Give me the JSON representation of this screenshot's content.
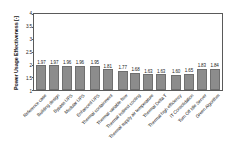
{
  "chart_data": {
    "type": "bar",
    "title": "",
    "xlabel": "",
    "ylabel": "Power Usage Effectiveness [-]",
    "ylim": [
      1,
      4
    ],
    "yticks": [
      1,
      1.5,
      2,
      2.5,
      3,
      3.5,
      4
    ],
    "ytick_labels": [
      "1",
      "1.5",
      "2",
      "2.5",
      "3",
      "3.5",
      "4"
    ],
    "grid": false,
    "legend": null,
    "bar_color": "#8c8c8c",
    "categories": [
      "Reference case",
      "Building design",
      "Bypass UPS",
      "Modular UPS",
      "Enhanced UPS",
      "Thermal containment",
      "Thermal variable flow",
      "Thermal indirect cooling",
      "Thermal supply air temperature",
      "Thermal Delta T",
      "Thermal high efficiency",
      "IT Consolidation",
      "Turn Off Idle Server",
      "Green Algorithm"
    ],
    "values": [
      1.97,
      1.97,
      1.96,
      1.96,
      1.95,
      1.81,
      1.77,
      1.68,
      1.63,
      1.63,
      1.6,
      1.65,
      1.83,
      1.84
    ],
    "value_labels": [
      "1.97",
      "1.97",
      "1.96",
      "1.96",
      "1.95",
      "1.81",
      "1.77",
      "1.68",
      "1.63",
      "1.63",
      "1.60",
      "1.65",
      "1.83",
      "1.84"
    ],
    "group_breaks_after": [
      4,
      6,
      10
    ]
  }
}
